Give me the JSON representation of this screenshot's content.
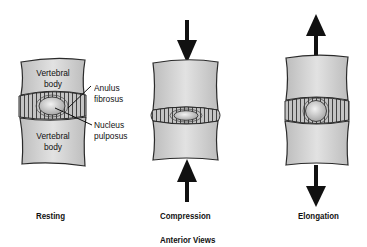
{
  "figure": {
    "caption": "Anterior Views",
    "panels": [
      {
        "id": "resting",
        "label": "Resting",
        "annotations": {
          "upper_body": [
            "Vertebral",
            "body"
          ],
          "lower_body": [
            "Vertebral",
            "body"
          ],
          "anulus": [
            "Anulus",
            "fibrosus"
          ],
          "nucleus": [
            "Nucleus",
            "pulposus"
          ]
        }
      },
      {
        "id": "compression",
        "label": "Compression",
        "arrows": "inward"
      },
      {
        "id": "elongation",
        "label": "Elongation",
        "arrows": "outward"
      }
    ]
  },
  "colors": {
    "bone_fill": "#d4d4d4",
    "outline": "#2a2a2a",
    "disc_fill": "#b9b9b9",
    "nucleus_fill": "#cfcfcf",
    "arrow": "#111111"
  }
}
